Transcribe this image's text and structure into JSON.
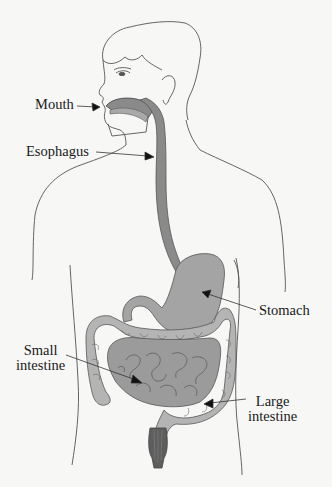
{
  "diagram": {
    "labels": {
      "mouth": "Mouth",
      "esophagus": "Esophagus",
      "stomach": "Stomach",
      "small_intestine": [
        "Small",
        "intestine"
      ],
      "large_intestine": [
        "Large",
        "intestine"
      ]
    },
    "colors": {
      "background": "#f7f7f5",
      "outline": "#555555",
      "organ_dark": "#8a8a8a",
      "organ_mid": "#a9a9a9",
      "organ_light": "#c4c4c4",
      "rectum_dark": "#5e5e5e",
      "text": "#1a1a1a"
    }
  }
}
